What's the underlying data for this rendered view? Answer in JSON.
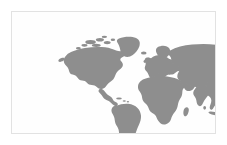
{
  "figure": {
    "type": "world-map",
    "projection": "equirectangular",
    "caption": ""
  },
  "colors": {
    "background": "#ffffff",
    "panel_background": "#fefefe",
    "panel_border": "#e2e2e2",
    "land": "#8a8a8a",
    "land_stipple_light": "#a8a8a8",
    "ocean": "#fefefe"
  },
  "panel": {
    "x": 11,
    "y": 11,
    "width": 205,
    "height": 123,
    "border_width": 1
  },
  "map": {
    "style": "stippled-silhouette",
    "includes_antarctica": false,
    "graticule": false,
    "labels": [],
    "legend": [],
    "regions": [
      {
        "name": "North America",
        "label": ""
      },
      {
        "name": "Greenland",
        "label": ""
      },
      {
        "name": "Canadian Arctic Archipelago",
        "label": ""
      },
      {
        "name": "Central America",
        "label": ""
      },
      {
        "name": "Caribbean",
        "label": ""
      },
      {
        "name": "South America",
        "label": ""
      },
      {
        "name": "Europe",
        "label": ""
      },
      {
        "name": "Scandinavia",
        "label": ""
      },
      {
        "name": "British Isles",
        "label": ""
      },
      {
        "name": "Mediterranean",
        "label": ""
      },
      {
        "name": "Africa",
        "label": ""
      },
      {
        "name": "Madagascar",
        "label": ""
      },
      {
        "name": "Middle East",
        "label": ""
      },
      {
        "name": "Arabian Peninsula",
        "label": ""
      },
      {
        "name": "Russia",
        "label": ""
      },
      {
        "name": "Central Asia",
        "label": ""
      },
      {
        "name": "India",
        "label": ""
      },
      {
        "name": "Sri Lanka",
        "label": ""
      },
      {
        "name": "China",
        "label": ""
      },
      {
        "name": "Southeast Asia",
        "label": ""
      },
      {
        "name": "Japan",
        "label": ""
      },
      {
        "name": "Korea",
        "label": ""
      },
      {
        "name": "Indonesia",
        "label": ""
      },
      {
        "name": "Philippines",
        "label": ""
      },
      {
        "name": "New Guinea",
        "label": ""
      },
      {
        "name": "Australia",
        "label": ""
      },
      {
        "name": "New Zealand",
        "label": ""
      },
      {
        "name": "Iceland",
        "label": ""
      }
    ]
  }
}
